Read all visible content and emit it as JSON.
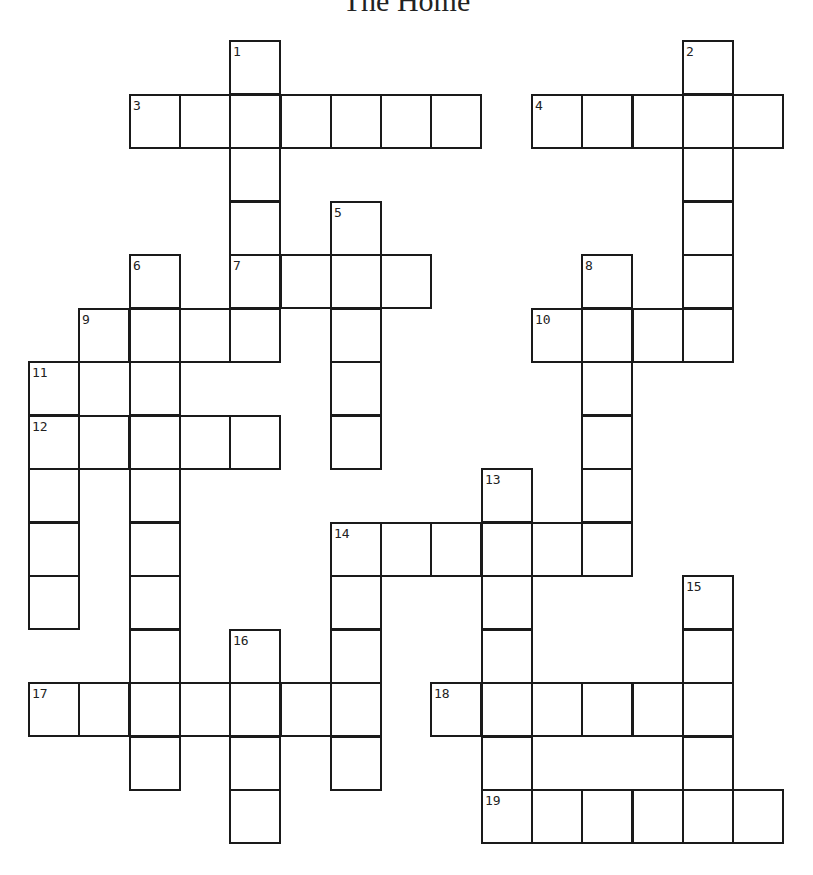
{
  "title": "The Home",
  "grid": {
    "origin_x": 28,
    "origin_y": 40,
    "cell_w": 50.3,
    "cell_h": 53.5,
    "cols": 15,
    "rows": 15
  },
  "entries": [
    {
      "number": 1,
      "direction": "down",
      "row": 0,
      "col": 4,
      "length": 6
    },
    {
      "number": 2,
      "direction": "down",
      "row": 0,
      "col": 13,
      "length": 6
    },
    {
      "number": 3,
      "direction": "across",
      "row": 1,
      "col": 2,
      "length": 7
    },
    {
      "number": 4,
      "direction": "across",
      "row": 1,
      "col": 10,
      "length": 5
    },
    {
      "number": 5,
      "direction": "down",
      "row": 3,
      "col": 6,
      "length": 5
    },
    {
      "number": 6,
      "direction": "down",
      "row": 4,
      "col": 2,
      "length": 10
    },
    {
      "number": 7,
      "direction": "across",
      "row": 4,
      "col": 4,
      "length": 4
    },
    {
      "number": 8,
      "direction": "down",
      "row": 4,
      "col": 11,
      "length": 6
    },
    {
      "number": 9,
      "direction": "across",
      "row": 5,
      "col": 1,
      "length": 4
    },
    {
      "number": 10,
      "direction": "across",
      "row": 5,
      "col": 10,
      "length": 4
    },
    {
      "number": 11,
      "direction": "down",
      "row": 6,
      "col": 0,
      "length": 5
    },
    {
      "number": 12,
      "direction": "across",
      "row": 7,
      "col": 0,
      "length": 5
    },
    {
      "number": 13,
      "direction": "down",
      "row": 8,
      "col": 9,
      "length": 6
    },
    {
      "number": 14,
      "direction": "across",
      "row": 9,
      "col": 6,
      "length": 6
    },
    {
      "number": 14,
      "direction": "down",
      "row": 9,
      "col": 6,
      "length": 5
    },
    {
      "number": 15,
      "direction": "down",
      "row": 10,
      "col": 13,
      "length": 5
    },
    {
      "number": 16,
      "direction": "down",
      "row": 11,
      "col": 4,
      "length": 4
    },
    {
      "number": 17,
      "direction": "across",
      "row": 12,
      "col": 0,
      "length": 7
    },
    {
      "number": 18,
      "direction": "across",
      "row": 12,
      "col": 8,
      "length": 6
    },
    {
      "number": 19,
      "direction": "across",
      "row": 14,
      "col": 9,
      "length": 6
    }
  ]
}
